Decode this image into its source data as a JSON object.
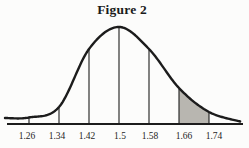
{
  "figure": {
    "title": "Figure 2"
  },
  "chart_data": {
    "type": "area",
    "title": "Figure 2",
    "distribution": {
      "mean": 1.5,
      "sigma": 0.08
    },
    "x_ticks": [
      "1.26",
      "1.34",
      "1.42",
      "1.5",
      "1.58",
      "1.66",
      "1.74"
    ],
    "x_tick_values": [
      1.26,
      1.34,
      1.42,
      1.5,
      1.58,
      1.66,
      1.74
    ],
    "vertical_lines_at": [
      1.26,
      1.34,
      1.42,
      1.5,
      1.58,
      1.66,
      1.74
    ],
    "shaded_region": {
      "from": 1.66,
      "to": 1.74
    },
    "xlim": [
      1.196,
      1.824
    ],
    "grid": false,
    "legend": false,
    "curve_profile": [
      {
        "x": 1.196,
        "h": 0.062
      },
      {
        "x": 1.26,
        "h": 0.067
      },
      {
        "x": 1.34,
        "h": 0.175
      },
      {
        "x": 1.42,
        "h": 0.773
      },
      {
        "x": 1.5,
        "h": 1.0
      },
      {
        "x": 1.58,
        "h": 0.773
      },
      {
        "x": 1.66,
        "h": 0.371
      },
      {
        "x": 1.74,
        "h": 0.124
      },
      {
        "x": 1.823,
        "h": 0.026
      }
    ],
    "colors": {
      "curve": "#1c1c1c",
      "axis": "#1c1c1c",
      "shade": "#b8b6b0",
      "labels": "#1e1e1e",
      "background": "#fcfcfb"
    }
  }
}
